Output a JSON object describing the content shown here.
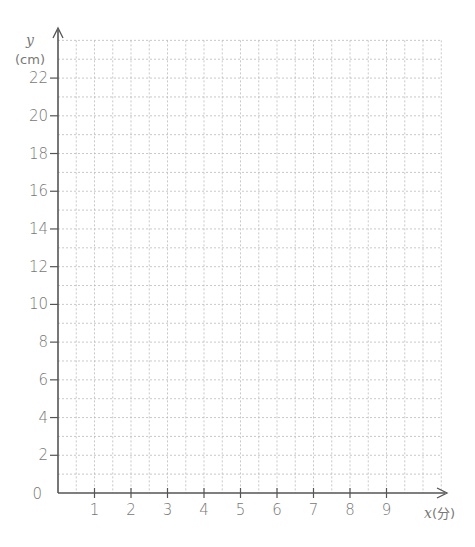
{
  "chart_data": {
    "type": "line",
    "title": "",
    "xlabel": "x",
    "xunit": "(分)",
    "ylabel": "y",
    "yunit": "(cm)",
    "x_ticks": [
      "1",
      "2",
      "3",
      "4",
      "5",
      "6",
      "7",
      "8",
      "9"
    ],
    "y_ticks": [
      "0",
      "2",
      "4",
      "6",
      "8",
      "10",
      "12",
      "14",
      "16",
      "18",
      "20",
      "22"
    ],
    "xlim": [
      0,
      10.5
    ],
    "ylim": [
      0,
      24
    ],
    "x_grid_step": 0.5,
    "y_grid_step": 1,
    "grid": true,
    "grid_style": "dotted",
    "series": [],
    "origin_label": "0"
  },
  "colors": {
    "axis": "#555555",
    "grid": "#bbbbbb",
    "text": "#777777"
  }
}
